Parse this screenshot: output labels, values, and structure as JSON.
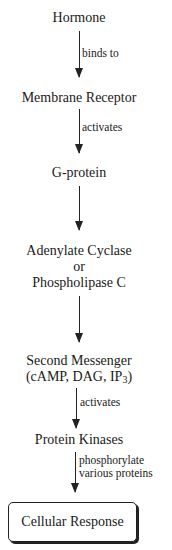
{
  "diagram": {
    "nodes": [
      {
        "id": "hormone",
        "label": "Hormone"
      },
      {
        "id": "receptor",
        "label": "Membrane Receptor"
      },
      {
        "id": "gprotein",
        "label": "G-protein"
      },
      {
        "id": "enzyme",
        "line1": "Adenylate Cyclase",
        "line2": "or",
        "line3": "Phospholipase C"
      },
      {
        "id": "second",
        "line1": "Second Messenger",
        "line2_prefix": "(cAMP, DAG, IP",
        "line2_sub": "3",
        "line2_suffix": ")"
      },
      {
        "id": "kinases",
        "label": "Protein Kinases"
      },
      {
        "id": "response",
        "label": "Cellular Response"
      }
    ],
    "edges": [
      {
        "from": "hormone",
        "to": "receptor",
        "label": "binds to"
      },
      {
        "from": "receptor",
        "to": "gprotein",
        "label": "activates"
      },
      {
        "from": "gprotein",
        "to": "enzyme",
        "label": ""
      },
      {
        "from": "enzyme",
        "to": "second",
        "label": ""
      },
      {
        "from": "second",
        "to": "kinases",
        "label": "activates"
      },
      {
        "from": "kinases",
        "to": "response",
        "line1": "phosphorylate",
        "line2": "various proteins"
      }
    ]
  }
}
